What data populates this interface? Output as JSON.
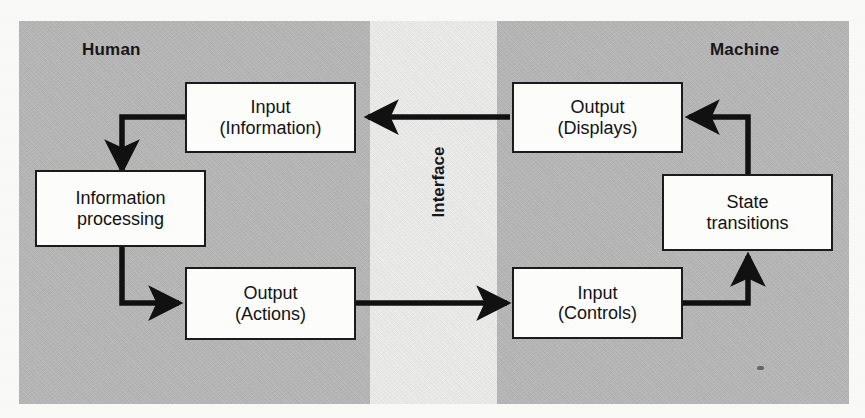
{
  "figure": {
    "regions": {
      "left_label": "Human",
      "center_label": "Interface",
      "right_label": "Machine"
    },
    "colors": {
      "panel_gray": "#b8b8b8",
      "interface_band": "#efefed",
      "box_fill": "#fcfcfa",
      "box_stroke": "#1b1b1b",
      "arrow": "#111111",
      "page_background": "#fbfbfa"
    },
    "nodes": [
      {
        "id": "human-input",
        "line1": "Input",
        "line2": "(Information)",
        "side": "human"
      },
      {
        "id": "information-processing",
        "line1": "Information",
        "line2": "processing",
        "side": "human"
      },
      {
        "id": "human-output",
        "line1": "Output",
        "line2": "(Actions)",
        "side": "human"
      },
      {
        "id": "machine-output",
        "line1": "Output",
        "line2": "(Displays)",
        "side": "machine"
      },
      {
        "id": "state-transitions",
        "line1": "State",
        "line2": "transitions",
        "side": "machine"
      },
      {
        "id": "machine-input",
        "line1": "Input",
        "line2": "(Controls)",
        "side": "machine"
      }
    ],
    "edges": [
      {
        "id": "edge-displays-to-information",
        "from": "machine-output",
        "to": "human-input",
        "shape": "straight-left"
      },
      {
        "id": "edge-information-to-processing",
        "from": "human-input",
        "to": "information-processing",
        "shape": "elbow-down"
      },
      {
        "id": "edge-processing-to-actions",
        "from": "information-processing",
        "to": "human-output",
        "shape": "elbow-right"
      },
      {
        "id": "edge-actions-to-controls",
        "from": "human-output",
        "to": "machine-input",
        "shape": "straight-right"
      },
      {
        "id": "edge-controls-to-state",
        "from": "machine-input",
        "to": "state-transitions",
        "shape": "elbow-up"
      },
      {
        "id": "edge-state-to-displays",
        "from": "state-transitions",
        "to": "machine-output",
        "shape": "elbow-left"
      }
    ]
  }
}
